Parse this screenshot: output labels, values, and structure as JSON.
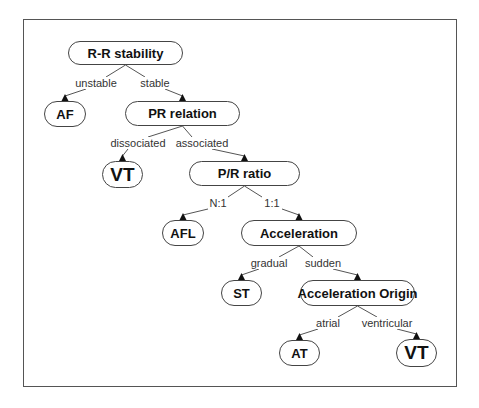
{
  "diagram": {
    "type": "decision-tree",
    "nodes": [
      {
        "id": "rr",
        "label": "R-R stability",
        "x": 68,
        "y": 41,
        "w": 115,
        "h": 24,
        "big": false
      },
      {
        "id": "af",
        "label": "AF",
        "x": 44,
        "y": 101,
        "w": 42,
        "h": 26,
        "big": false
      },
      {
        "id": "pr",
        "label": "PR relation",
        "x": 125,
        "y": 101,
        "w": 115,
        "h": 25,
        "big": false
      },
      {
        "id": "vt1",
        "label": "VT",
        "x": 102,
        "y": 161,
        "w": 41,
        "h": 27,
        "big": true
      },
      {
        "id": "prratio",
        "label": "P/R ratio",
        "x": 189,
        "y": 161,
        "w": 111,
        "h": 25,
        "big": false
      },
      {
        "id": "afl",
        "label": "AFL",
        "x": 162,
        "y": 220,
        "w": 42,
        "h": 26,
        "big": false
      },
      {
        "id": "acc",
        "label": "Acceleration",
        "x": 241,
        "y": 220,
        "w": 116,
        "h": 26,
        "big": false
      },
      {
        "id": "st",
        "label": "ST",
        "x": 221,
        "y": 280,
        "w": 41,
        "h": 26,
        "big": false
      },
      {
        "id": "accorig",
        "label": "Acceleration Origin",
        "x": 300,
        "y": 280,
        "w": 115,
        "h": 26,
        "big": false
      },
      {
        "id": "at",
        "label": "AT",
        "x": 279,
        "y": 340,
        "w": 41,
        "h": 26,
        "big": false
      },
      {
        "id": "vt2",
        "label": "VT",
        "x": 396,
        "y": 339,
        "w": 41,
        "h": 28,
        "big": true
      }
    ],
    "edges": [
      {
        "from": "rr",
        "to": "af",
        "label": "unstable",
        "lx": 96,
        "ly": 83
      },
      {
        "from": "rr",
        "to": "pr",
        "label": "stable",
        "lx": 155,
        "ly": 83
      },
      {
        "from": "pr",
        "to": "vt1",
        "label": "dissociated",
        "lx": 138,
        "ly": 143
      },
      {
        "from": "pr",
        "to": "prratio",
        "label": "associated",
        "lx": 202,
        "ly": 143
      },
      {
        "from": "prratio",
        "to": "afl",
        "label": "N:1",
        "lx": 218,
        "ly": 203
      },
      {
        "from": "prratio",
        "to": "acc",
        "label": "1:1",
        "lx": 272,
        "ly": 203
      },
      {
        "from": "acc",
        "to": "st",
        "label": "gradual",
        "lx": 269,
        "ly": 263
      },
      {
        "from": "acc",
        "to": "accorig",
        "label": "sudden",
        "lx": 323,
        "ly": 263
      },
      {
        "from": "accorig",
        "to": "at",
        "label": "atrial",
        "lx": 328,
        "ly": 323
      },
      {
        "from": "accorig",
        "to": "vt2",
        "label": "ventricular",
        "lx": 387,
        "ly": 323
      }
    ]
  },
  "colors": {
    "line": "#555555",
    "arrow": "#111111",
    "frame": "#555555"
  }
}
